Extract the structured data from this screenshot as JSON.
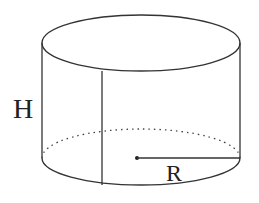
{
  "figure": {
    "type": "cylinder",
    "labels": {
      "height": "H",
      "radius": "R"
    },
    "colors": {
      "stroke": "#333333",
      "background": "#ffffff"
    }
  }
}
